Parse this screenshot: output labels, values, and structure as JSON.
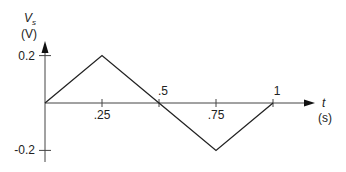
{
  "chart_data": {
    "type": "line",
    "title": "",
    "ylabel": "V_s",
    "ylabel_sub": "s",
    "ylabel_unit": "(V)",
    "xlabel": "t",
    "xlabel_unit": "(s)",
    "x": [
      0,
      0.25,
      0.5,
      0.75,
      1
    ],
    "series": [
      {
        "name": "V_s",
        "values": [
          0,
          0.2,
          0,
          -0.2,
          0
        ]
      }
    ],
    "xticks": [
      {
        "value": 0.25,
        "label": ".25",
        "pos": "below"
      },
      {
        "value": 0.5,
        "label": ".5",
        "pos": "above"
      },
      {
        "value": 0.75,
        "label": ".75",
        "pos": "below"
      },
      {
        "value": 1,
        "label": "1",
        "pos": "above"
      }
    ],
    "yticks": [
      {
        "value": 0.2,
        "label": "0.2"
      },
      {
        "value": -0.2,
        "label": "-0.2"
      }
    ],
    "xlim": [
      0,
      1.15
    ],
    "ylim": [
      -0.22,
      0.28
    ],
    "grid": false,
    "legend": "none",
    "colors": {
      "line": "#222222",
      "axis": "#444444"
    }
  }
}
